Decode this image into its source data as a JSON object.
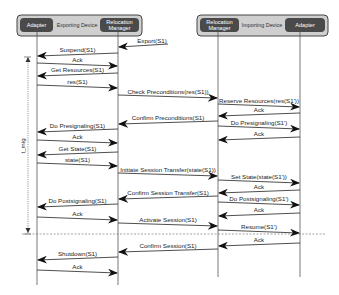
{
  "devices": {
    "exporting": {
      "label": "Exporting Device",
      "left_actor": "Adapter",
      "right_actor_line1": "Relocation",
      "right_actor_line2": "Manager"
    },
    "importing": {
      "label": "Importing Device",
      "left_actor_line1": "Relocation",
      "left_actor_line2": "Manager",
      "right_actor": "Adapter"
    }
  },
  "timer_label": "t_mig",
  "colors": {
    "device_box": "#cfcfcf",
    "actor_box": "#4a4a4a",
    "line": "#222222"
  },
  "messages": [
    {
      "label": "Export(S1)",
      "from": "external",
      "to": "rm1",
      "y": 47
    },
    {
      "label": "Suspend(S1)",
      "from": "rm1",
      "to": "ad1",
      "y": 56
    },
    {
      "label": "Ack",
      "from": "ad1",
      "to": "rm1",
      "y": 66
    },
    {
      "label": "Get Resources(S1)",
      "from": "rm1",
      "to": "ad1",
      "y": 76
    },
    {
      "label": "res(S1)",
      "from": "ad1",
      "to": "rm1",
      "y": 88
    },
    {
      "label": "Check Preconditions(res(S1))",
      "from": "rm1",
      "to": "rm2",
      "y": 98
    },
    {
      "label": "Reserve Resources(res(S1'))",
      "from": "rm2",
      "to": "ad2",
      "y": 107
    },
    {
      "label": "Ack",
      "from": "ad2",
      "to": "rm2",
      "y": 116
    },
    {
      "label": "Confirm Preconditions(S1)",
      "from": "rm2",
      "to": "rm1",
      "y": 124
    },
    {
      "label": "Do Presignaling(S1')",
      "from": "rm2",
      "to": "ad2",
      "y": 129
    },
    {
      "label": "Do Presignaling(S1)",
      "from": "rm1",
      "to": "ad1",
      "y": 132
    },
    {
      "label": "Ack",
      "from": "ad2",
      "to": "rm2",
      "y": 140
    },
    {
      "label": "Ack",
      "from": "ad1",
      "to": "rm1",
      "y": 143
    },
    {
      "label": "Get State(S1)",
      "from": "rm1",
      "to": "ad1",
      "y": 155
    },
    {
      "label": "state(S1)",
      "from": "ad1",
      "to": "rm1",
      "y": 166
    },
    {
      "label": "Initiate Session Transfer(state(S1))",
      "from": "rm1",
      "to": "rm2",
      "y": 176
    },
    {
      "label": "Set State(state(S1'))",
      "from": "rm2",
      "to": "ad2",
      "y": 183
    },
    {
      "label": "Ack",
      "from": "ad2",
      "to": "rm2",
      "y": 193
    },
    {
      "label": "Confirm Session Transfer(S1)",
      "from": "rm2",
      "to": "rm1",
      "y": 199
    },
    {
      "label": "Do Postsignaling(S1')",
      "from": "rm2",
      "to": "ad2",
      "y": 205
    },
    {
      "label": "Do Postsignaling(S1)",
      "from": "rm1",
      "to": "ad1",
      "y": 207
    },
    {
      "label": "Ack",
      "from": "ad2",
      "to": "rm2",
      "y": 216
    },
    {
      "label": "Ack",
      "from": "ad1",
      "to": "rm1",
      "y": 220
    },
    {
      "label": "Activate Session(S1)",
      "from": "rm1",
      "to": "rm2",
      "y": 226
    },
    {
      "label": "Resume(S1')",
      "from": "rm2",
      "to": "ad2",
      "y": 233
    },
    {
      "label": "Ack",
      "from": "ad2",
      "to": "rm2",
      "y": 246
    },
    {
      "label": "Confirm Session(S1)",
      "from": "rm2",
      "to": "rm1",
      "y": 252
    },
    {
      "label": "Shutdown(S1)",
      "from": "rm1",
      "to": "ad1",
      "y": 260
    },
    {
      "label": "Ack",
      "from": "ad1",
      "to": "rm1",
      "y": 273
    }
  ]
}
